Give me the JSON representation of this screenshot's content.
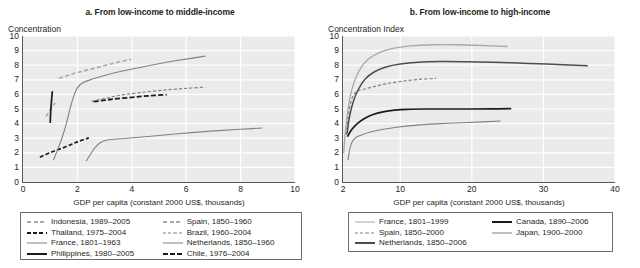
{
  "figure": {
    "panels": [
      {
        "id": "a",
        "title": "a. From low-income to middle-income",
        "ylabel": "Concentration",
        "xlabel": "GDP per capita (constant 2000 US$, thousands)",
        "yticks": [
          "10",
          "9",
          "8",
          "7",
          "6",
          "5",
          "4",
          "3",
          "2",
          "1",
          "0"
        ],
        "xticks": [
          "0",
          "2",
          "4",
          "6",
          "8",
          "10"
        ],
        "legend": [
          {
            "label": "Indonesia, 1989–2005",
            "style": "dashed-light"
          },
          {
            "label": "Spain, 1850–1960",
            "style": "dashed-light"
          },
          {
            "label": "Thailand, 1975–2004",
            "style": "dashed-dark"
          },
          {
            "label": "Brazil, 1960–2004",
            "style": "dashed-gray"
          },
          {
            "label": "France, 1801–1963",
            "style": "solid-gray"
          },
          {
            "label": "Netherlands, 1850–1960",
            "style": "solid-gray"
          },
          {
            "label": "Philippines, 1980–2005",
            "style": "solid-black"
          },
          {
            "label": "Chile, 1976–2004",
            "style": "dashed-black-thick"
          }
        ]
      },
      {
        "id": "b",
        "title": "b. From low-income to high-income",
        "ylabel": "Concentration Index",
        "xlabel": "GDP per capita (constant 2000 US$, thousands)",
        "yticks": [
          "10",
          "9",
          "8",
          "7",
          "6",
          "5",
          "4",
          "3",
          "2",
          "1",
          "0"
        ],
        "xticks": [
          "2",
          "10",
          "20",
          "30",
          "40"
        ],
        "legend": [
          {
            "label": "France, 1801–1999",
            "style": "solid-light"
          },
          {
            "label": "Canada, 1890–2006",
            "style": "solid-black"
          },
          {
            "label": "Spain, 1850–2000",
            "style": "dashed-gray"
          },
          {
            "label": "Japan, 1900–2000",
            "style": "solid-gray"
          },
          {
            "label": "Netherlands, 1850–2006",
            "style": "solid-darkgray"
          }
        ]
      }
    ]
  },
  "colors": {
    "plot_background": "#ebebeb",
    "gridline": "#ffffff",
    "axis": "#58595b",
    "series_black": "#1a1a1a",
    "series_darkgray": "#4d4d4f",
    "series_gray": "#808285",
    "series_light": "#a7a9ac",
    "text": "#231f20"
  },
  "chart_data": [
    {
      "type": "line",
      "title": "a. From low-income to middle-income",
      "xlabel": "GDP per capita (constant 2000 US$, thousands)",
      "ylabel": "Concentration",
      "xlim": [
        0,
        10
      ],
      "ylim": [
        0,
        10
      ],
      "xticks": [
        0,
        2,
        4,
        6,
        8,
        10
      ],
      "yticks": [
        0,
        1,
        2,
        3,
        4,
        5,
        6,
        7,
        8,
        9,
        10
      ],
      "grid": "horizontal-and-vertical",
      "legend_position": "below",
      "series": [
        {
          "name": "Indonesia, 1989–2005",
          "style": "dashed-light",
          "points": [
            [
              0.84,
              4.48
            ],
            [
              0.95,
              4.78
            ],
            [
              1.05,
              5.08
            ],
            [
              1.18,
              5.42
            ]
          ]
        },
        {
          "name": "Thailand, 1975–2004",
          "style": "dashed-dark",
          "points": [
            [
              0.62,
              1.7
            ],
            [
              1.05,
              2.05
            ],
            [
              1.55,
              2.4
            ],
            [
              2.0,
              2.75
            ],
            [
              2.42,
              3.02
            ]
          ]
        },
        {
          "name": "France, 1801–1963",
          "style": "solid-gray",
          "points": [
            [
              1.12,
              1.5
            ],
            [
              1.28,
              2.25
            ],
            [
              1.45,
              3.1
            ],
            [
              1.6,
              4.05
            ],
            [
              1.72,
              4.95
            ],
            [
              1.85,
              5.8
            ],
            [
              2.0,
              6.45
            ],
            [
              2.2,
              6.8
            ],
            [
              2.55,
              7.05
            ],
            [
              3.1,
              7.35
            ],
            [
              3.8,
              7.65
            ],
            [
              4.7,
              8.0
            ],
            [
              5.6,
              8.3
            ],
            [
              6.7,
              8.62
            ]
          ]
        },
        {
          "name": "Philippines, 1980–2005",
          "style": "solid-black",
          "points": [
            [
              1.08,
              6.22
            ],
            [
              1.05,
              5.6
            ],
            [
              1.02,
              4.9
            ],
            [
              1.0,
              4.05
            ]
          ]
        },
        {
          "name": "Spain, 1850–1960",
          "style": "dashed-light",
          "points": [
            [
              1.32,
              7.1
            ],
            [
              1.9,
              7.45
            ],
            [
              2.55,
              7.75
            ],
            [
              3.25,
              8.1
            ],
            [
              3.98,
              8.4
            ]
          ]
        },
        {
          "name": "Brazil, 1960–2004",
          "style": "dashed-gray",
          "points": [
            [
              2.52,
              5.52
            ],
            [
              3.0,
              5.72
            ],
            [
              3.6,
              5.95
            ],
            [
              4.3,
              6.12
            ],
            [
              5.1,
              6.28
            ],
            [
              5.9,
              6.4
            ],
            [
              6.7,
              6.5
            ]
          ]
        },
        {
          "name": "Netherlands, 1850–1960",
          "style": "solid-gray",
          "points": [
            [
              2.32,
              1.42
            ],
            [
              2.48,
              1.9
            ],
            [
              2.65,
              2.35
            ],
            [
              2.85,
              2.7
            ],
            [
              3.1,
              2.88
            ],
            [
              3.7,
              2.98
            ],
            [
              4.6,
              3.12
            ],
            [
              5.8,
              3.32
            ],
            [
              7.2,
              3.52
            ],
            [
              8.8,
              3.7
            ]
          ]
        },
        {
          "name": "Chile, 1976–2004",
          "style": "dashed-black-thick",
          "points": [
            [
              2.6,
              5.5
            ],
            [
              3.2,
              5.65
            ],
            [
              3.9,
              5.78
            ],
            [
              4.6,
              5.9
            ],
            [
              5.28,
              5.98
            ]
          ]
        }
      ]
    },
    {
      "type": "line",
      "title": "b. From low-income to high-income",
      "xlabel": "GDP per capita (constant 2000 US$, thousands)",
      "ylabel": "Concentration Index",
      "xlim": [
        2,
        40
      ],
      "ylim": [
        0,
        10
      ],
      "xticks": [
        2,
        10,
        20,
        30,
        40
      ],
      "yticks": [
        0,
        1,
        2,
        3,
        4,
        5,
        6,
        7,
        8,
        9,
        10
      ],
      "grid": "horizontal-and-vertical",
      "legend_position": "below",
      "series": [
        {
          "name": "France, 1801–1999",
          "style": "solid-light",
          "points": [
            [
              2.1,
              1.98
            ],
            [
              2.3,
              3.3
            ],
            [
              2.6,
              4.6
            ],
            [
              3.0,
              5.85
            ],
            [
              3.6,
              6.9
            ],
            [
              4.4,
              7.75
            ],
            [
              5.5,
              8.4
            ],
            [
              7.0,
              8.85
            ],
            [
              9.0,
              9.15
            ],
            [
              11.5,
              9.32
            ],
            [
              14.5,
              9.4
            ],
            [
              18.0,
              9.4
            ],
            [
              21.5,
              9.35
            ],
            [
              25.0,
              9.28
            ]
          ]
        },
        {
          "name": "Spain, 1850–2000",
          "style": "dashed-gray",
          "points": [
            [
              2.48,
              3.22
            ],
            [
              2.7,
              4.3
            ],
            [
              3.0,
              5.25
            ],
            [
              3.4,
              5.9
            ],
            [
              4.0,
              6.22
            ],
            [
              4.9,
              6.35
            ],
            [
              6.2,
              6.52
            ],
            [
              8.0,
              6.72
            ],
            [
              10.2,
              6.9
            ],
            [
              12.5,
              7.02
            ],
            [
              15.0,
              7.1
            ]
          ]
        },
        {
          "name": "Netherlands, 1850–2006",
          "style": "solid-darkgray",
          "points": [
            [
              2.58,
              3.32
            ],
            [
              2.9,
              4.45
            ],
            [
              3.4,
              5.45
            ],
            [
              4.1,
              6.3
            ],
            [
              5.1,
              7.05
            ],
            [
              6.4,
              7.55
            ],
            [
              8.0,
              7.88
            ],
            [
              10.0,
              8.08
            ],
            [
              12.5,
              8.2
            ],
            [
              15.5,
              8.25
            ],
            [
              19.0,
              8.24
            ],
            [
              23.0,
              8.2
            ],
            [
              28.0,
              8.12
            ],
            [
              32.0,
              8.05
            ],
            [
              36.2,
              7.96
            ]
          ]
        },
        {
          "name": "Canada, 1890–2006",
          "style": "solid-black",
          "points": [
            [
              2.62,
              3.1
            ],
            [
              3.2,
              3.58
            ],
            [
              4.0,
              4.0
            ],
            [
              5.0,
              4.35
            ],
            [
              6.2,
              4.62
            ],
            [
              7.6,
              4.8
            ],
            [
              9.2,
              4.92
            ],
            [
              11.0,
              4.98
            ],
            [
              13.5,
              5.0
            ],
            [
              16.5,
              5.0
            ],
            [
              20.0,
              5.0
            ],
            [
              23.0,
              5.01
            ],
            [
              25.5,
              5.02
            ]
          ]
        },
        {
          "name": "Japan, 1900–2000",
          "style": "solid-gray",
          "points": [
            [
              2.7,
              1.5
            ],
            [
              2.95,
              2.25
            ],
            [
              3.3,
              2.78
            ],
            [
              3.8,
              3.05
            ],
            [
              4.6,
              3.22
            ],
            [
              5.8,
              3.42
            ],
            [
              7.4,
              3.6
            ],
            [
              9.5,
              3.75
            ],
            [
              12.0,
              3.88
            ],
            [
              15.0,
              3.98
            ],
            [
              18.5,
              4.06
            ],
            [
              21.5,
              4.12
            ],
            [
              24.0,
              4.18
            ]
          ]
        }
      ]
    }
  ]
}
